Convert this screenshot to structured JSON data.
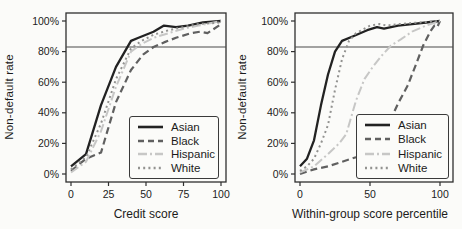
{
  "figure": {
    "background": "#fbfbf9",
    "axis_color": "#2e2e2e",
    "text_color": "#1b1b1b",
    "reference_line_color": "#4a4a4a"
  },
  "chart_data": [
    {
      "type": "line",
      "title": "",
      "xlabel": "Credit score",
      "ylabel": "Non-default rate",
      "xlim": [
        0,
        100
      ],
      "ylim": [
        0,
        100
      ],
      "grid": false,
      "legend_position": "lower-right-box",
      "reference_line_y": 83,
      "xtick_values": [
        0,
        25,
        50,
        75,
        100
      ],
      "xtick_labels": [
        "0",
        "25",
        "50",
        "75",
        "100"
      ],
      "ytick_values": [
        0,
        20,
        40,
        60,
        80,
        100
      ],
      "ytick_labels": [
        "0%",
        "20%",
        "40%",
        "60%",
        "80%",
        "100%"
      ],
      "series": [
        {
          "name": "Asian",
          "color": "#222222",
          "dash": "",
          "width": 2.3,
          "points": [
            [
              0,
              5
            ],
            [
              10,
              13
            ],
            [
              20,
              45
            ],
            [
              30,
              70
            ],
            [
              40,
              87
            ],
            [
              45,
              89
            ],
            [
              55,
              93
            ],
            [
              62,
              97
            ],
            [
              70,
              96
            ],
            [
              78,
              97
            ],
            [
              88,
              99
            ],
            [
              100,
              100
            ]
          ]
        },
        {
          "name": "Black",
          "color": "#606060",
          "dash": "7 4",
          "width": 2.2,
          "points": [
            [
              0,
              2
            ],
            [
              10,
              10
            ],
            [
              20,
              14
            ],
            [
              30,
              47
            ],
            [
              40,
              68
            ],
            [
              48,
              78
            ],
            [
              55,
              83
            ],
            [
              62,
              86
            ],
            [
              70,
              89
            ],
            [
              80,
              92
            ],
            [
              86,
              93
            ],
            [
              91,
              92
            ],
            [
              100,
              98
            ]
          ]
        },
        {
          "name": "Hispanic",
          "color": "#c7c7c6",
          "dash": "9 3 2 3",
          "width": 2,
          "points": [
            [
              0,
              1
            ],
            [
              10,
              8
            ],
            [
              20,
              28
            ],
            [
              30,
              57
            ],
            [
              40,
              80
            ],
            [
              47,
              85
            ],
            [
              55,
              89
            ],
            [
              65,
              92
            ],
            [
              75,
              95
            ],
            [
              85,
              97
            ],
            [
              100,
              100
            ]
          ]
        },
        {
          "name": "White",
          "color": "#929290",
          "dash": "2 3.2",
          "width": 2,
          "points": [
            [
              0,
              3
            ],
            [
              10,
              11
            ],
            [
              20,
              33
            ],
            [
              30,
              62
            ],
            [
              40,
              82
            ],
            [
              47,
              87
            ],
            [
              55,
              91
            ],
            [
              65,
              94
            ],
            [
              75,
              96
            ],
            [
              85,
              98
            ],
            [
              100,
              99
            ]
          ]
        }
      ]
    },
    {
      "type": "line",
      "title": "",
      "xlabel": "Within-group score percentile",
      "ylabel": "Non-default rate",
      "xlim": [
        0,
        100
      ],
      "ylim": [
        0,
        100
      ],
      "grid": false,
      "legend_position": "lower-right-box",
      "reference_line_y": 83,
      "xtick_values": [
        0,
        50,
        100
      ],
      "xtick_labels": [
        "0",
        "50",
        "100"
      ],
      "ytick_values": [
        0,
        20,
        40,
        60,
        80,
        100
      ],
      "ytick_labels": [
        "0%",
        "20%",
        "40%",
        "60%",
        "80%",
        "100%"
      ],
      "series": [
        {
          "name": "Asian",
          "color": "#222222",
          "dash": "",
          "width": 2.3,
          "points": [
            [
              0,
              5
            ],
            [
              5,
              10
            ],
            [
              10,
              22
            ],
            [
              15,
              45
            ],
            [
              20,
              65
            ],
            [
              25,
              80
            ],
            [
              30,
              87
            ],
            [
              38,
              90
            ],
            [
              48,
              94
            ],
            [
              55,
              96
            ],
            [
              60,
              95
            ],
            [
              70,
              97
            ],
            [
              80,
              98
            ],
            [
              90,
              99
            ],
            [
              100,
              100
            ]
          ]
        },
        {
          "name": "Black",
          "color": "#606060",
          "dash": "7 4",
          "width": 2.2,
          "points": [
            [
              0,
              0
            ],
            [
              10,
              3
            ],
            [
              20,
              5
            ],
            [
              30,
              8
            ],
            [
              40,
              11
            ],
            [
              50,
              15
            ],
            [
              57,
              23
            ],
            [
              63,
              32
            ],
            [
              70,
              46
            ],
            [
              77,
              58
            ],
            [
              83,
              72
            ],
            [
              88,
              84
            ],
            [
              93,
              93
            ],
            [
              96,
              97
            ],
            [
              98,
              96
            ],
            [
              100,
              100
            ]
          ]
        },
        {
          "name": "Hispanic",
          "color": "#c7c7c6",
          "dash": "9 3 2 3",
          "width": 2,
          "points": [
            [
              0,
              1
            ],
            [
              10,
              5
            ],
            [
              20,
              13
            ],
            [
              28,
              20
            ],
            [
              33,
              26
            ],
            [
              40,
              48
            ],
            [
              46,
              62
            ],
            [
              52,
              70
            ],
            [
              58,
              77
            ],
            [
              65,
              84
            ],
            [
              72,
              88
            ],
            [
              80,
              93
            ],
            [
              90,
              97
            ],
            [
              100,
              100
            ]
          ]
        },
        {
          "name": "White",
          "color": "#929290",
          "dash": "2 3.2",
          "width": 2,
          "points": [
            [
              0,
              2
            ],
            [
              5,
              5
            ],
            [
              10,
              10
            ],
            [
              15,
              20
            ],
            [
              20,
              32
            ],
            [
              25,
              55
            ],
            [
              30,
              75
            ],
            [
              35,
              87
            ],
            [
              40,
              92
            ],
            [
              50,
              97
            ],
            [
              57,
              98
            ],
            [
              62,
              97
            ],
            [
              70,
              98
            ],
            [
              85,
              99
            ],
            [
              100,
              100
            ]
          ]
        }
      ]
    }
  ]
}
